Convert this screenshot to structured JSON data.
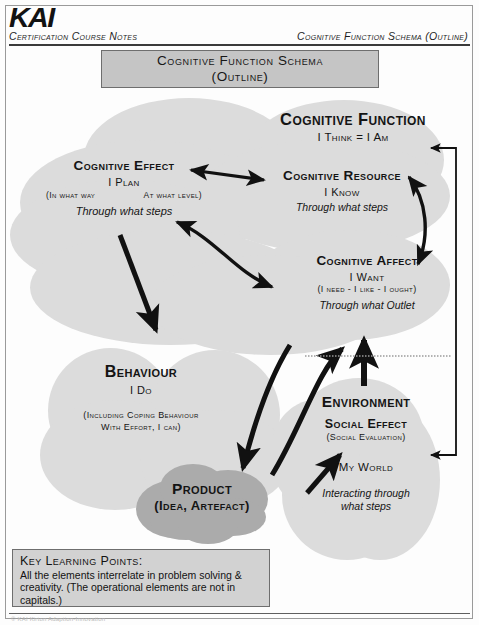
{
  "header": {
    "logo": "KAI",
    "left_label": "Certification Course Notes",
    "right_label": "Cognitive Function Schema (Outline)"
  },
  "title_box": {
    "line1": "Cognitive Function Schema",
    "line2": "(Outline)"
  },
  "colors": {
    "cloud_light": "#dcdcdc",
    "cloud_dark": "#ababab",
    "title_box_fill": "#c5c5c5",
    "klp_fill": "#d2d2d2",
    "ink": "#141414",
    "border": "#6e6e6e",
    "page_bg": "#fdfdfd"
  },
  "nodes": {
    "cognitive_function": {
      "head": "Cognitive Function",
      "sub": "I Think = I Am"
    },
    "cognitive_effect": {
      "head": "Cognitive Effect",
      "sub": "I Plan",
      "paren_left": "(In what way",
      "paren_right": "At what level)",
      "italic": "Through what steps"
    },
    "cognitive_resource": {
      "head": "Cognitive Resource",
      "sub": "I Know",
      "italic": "Through what steps"
    },
    "cognitive_affect": {
      "head": "Cognitive Affect",
      "sub": "I Want",
      "paren": "(I need - I like - I ought)",
      "italic": "Through what Outlet"
    },
    "behaviour": {
      "head": "Behaviour",
      "sub": "I Do",
      "paren_line1": "(Including Coping Behaviour",
      "paren_line2": "With Effort, I can)"
    },
    "environment": {
      "head": "Environment",
      "sub": "Social Effect",
      "paren": "(Social Evaluation)",
      "extra": "My World",
      "italic_line1": "Interacting through",
      "italic_line2": "what steps"
    },
    "product": {
      "head": "Product",
      "sub": "(Idea, Artefact)"
    }
  },
  "key_learning_points": {
    "title": "Key Learning Points:",
    "body": "All the elements interrelate in problem solving & creativity. (The operational elements are not in capitals.)"
  },
  "footer": {
    "text": "© KAI Kirton Adaption-Innovation"
  },
  "connectors": {
    "effect_resource": "double-headed-arrow",
    "resource_affect": "curved-double-headed-arrow",
    "effect_affect": "curved-double-headed-arrow",
    "effect_behaviour": "double-headed-arrow",
    "behaviour_product": "curved-arrow-down",
    "product_affect": "curved-arrow-up",
    "environment_affect": "arrow-up",
    "product_social_effect": "arrow-up-right",
    "feedback_bracket": "right-side-bracket"
  }
}
